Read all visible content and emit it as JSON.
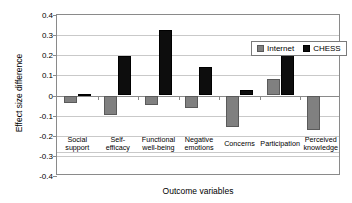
{
  "chart_data": {
    "type": "bar",
    "title": "",
    "xlabel": "Outcome variables",
    "ylabel": "Effect size difference",
    "categories": [
      "Social support",
      "Self-efficacy",
      "Functional well-being",
      "Negative emotions",
      "Concerns",
      "Participation",
      "Perceived knowledge"
    ],
    "category_lines": [
      [
        "Social",
        "support"
      ],
      [
        "Self-",
        "efficacy"
      ],
      [
        "Functional",
        "well-being"
      ],
      [
        "Negative",
        "emotions"
      ],
      [
        "Concerns"
      ],
      [
        "Participation"
      ],
      [
        "Perceived",
        "knowledge"
      ]
    ],
    "series": [
      {
        "name": "Internet",
        "color": "#808080",
        "values": [
          -0.035,
          -0.095,
          -0.045,
          -0.062,
          -0.158,
          0.082,
          -0.173
        ]
      },
      {
        "name": "CHESS",
        "color": "#0d0d0d",
        "values": [
          0.008,
          0.198,
          0.327,
          0.14,
          0.028,
          0.21,
          null
        ]
      }
    ],
    "ylim": [
      -0.4,
      0.4
    ],
    "yticks": [
      0.4,
      0.3,
      0.2,
      0.1,
      0,
      -0.1,
      -0.2,
      -0.3,
      -0.4
    ],
    "ytick_labels": [
      "0.4",
      "0.3",
      "0.2",
      "0.1",
      "0",
      "-0.1",
      "-0.2",
      "-0.3",
      "-0.4"
    ],
    "grid": true,
    "legend_position": "top-right",
    "legend_entries": [
      "Internet",
      "CHESS"
    ]
  }
}
